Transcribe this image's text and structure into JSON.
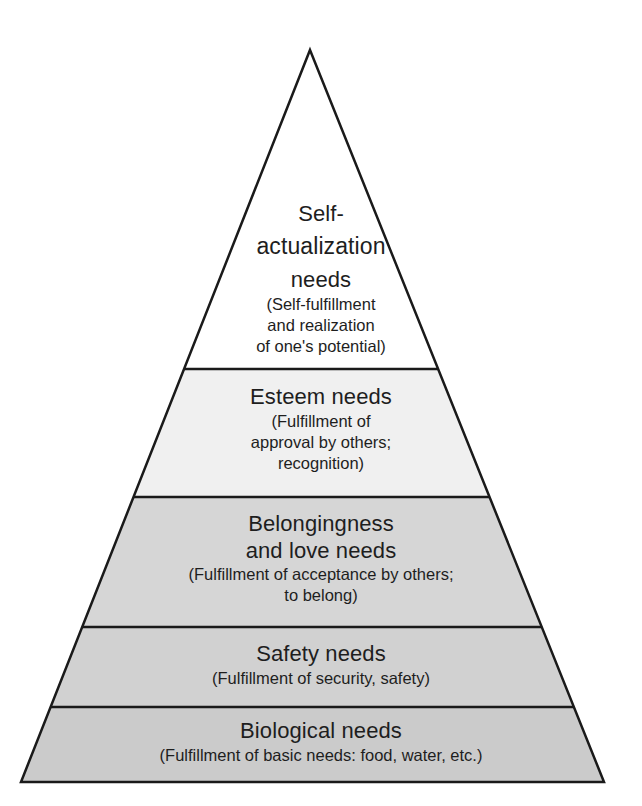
{
  "diagram": {
    "type": "pyramid",
    "colors": {
      "outline": "#1a1a1a",
      "text": "#1e1e1e",
      "background": "#ffffff"
    },
    "levels": [
      {
        "id": "self-actualization",
        "title_lines": [
          "Self-",
          "actualization",
          "needs"
        ],
        "subtitle_lines": [
          "(Self-fulfillment",
          "and realization",
          "of one's potential)"
        ],
        "fill": "#ffffff"
      },
      {
        "id": "esteem",
        "title_lines": [
          "Esteem needs"
        ],
        "subtitle_lines": [
          "(Fulfillment of",
          "approval by others;",
          "recognition)"
        ],
        "fill": "#f0f0f0"
      },
      {
        "id": "belongingness",
        "title_lines": [
          "Belongingness",
          "and love needs"
        ],
        "subtitle_lines": [
          "(Fulfillment of acceptance by others;",
          "to belong)"
        ],
        "fill": "#d6d6d6"
      },
      {
        "id": "safety",
        "title_lines": [
          "Safety needs"
        ],
        "subtitle_lines": [
          "(Fulfillment of security, safety)"
        ],
        "fill": "#d1d1d1"
      },
      {
        "id": "biological",
        "title_lines": [
          "Biological needs"
        ],
        "subtitle_lines": [
          "(Fulfillment of basic needs: food, water, etc.)"
        ],
        "fill": "#cbcbcb"
      }
    ]
  }
}
